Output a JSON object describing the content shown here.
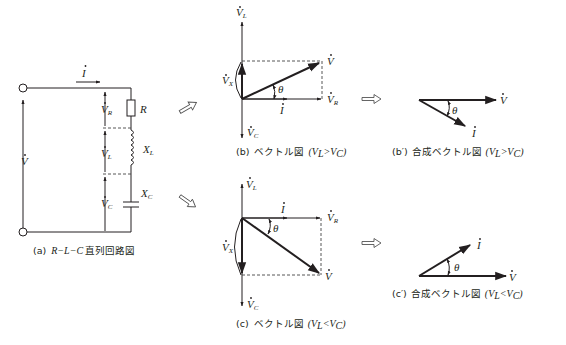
{
  "figure": {
    "panels": {
      "a": {
        "caption_prefix": "(a)",
        "caption_math": "R−L−C",
        "caption_text": "直列回路図",
        "labels": {
          "current": "I",
          "source_voltage": "V",
          "vr": "V",
          "vr_sub": "R",
          "vl": "V",
          "vl_sub": "L",
          "vc": "V",
          "vc_sub": "C",
          "resistor": "R",
          "xl": "X",
          "xl_sub": "L",
          "xc": "X",
          "xc_sub": "C"
        }
      },
      "b": {
        "caption_prefix": "(b)",
        "caption_text": "ベクトル図",
        "caption_cond": "(V",
        "cond_sub1": "L",
        "cond_op": ">V",
        "cond_sub2": "C",
        "cond_close": ")",
        "labels": {
          "vl": "V",
          "vl_sub": "L",
          "vc": "V",
          "vc_sub": "C",
          "vx": "V",
          "vx_sub": "X",
          "v": "V",
          "vr": "V",
          "vr_sub": "R",
          "i": "I",
          "theta": "θ"
        }
      },
      "b_prime": {
        "caption_prefix": "(b′)",
        "caption_text": "合成ベクトル図",
        "caption_cond": "(V",
        "cond_sub1": "L",
        "cond_op": ">V",
        "cond_sub2": "C",
        "cond_close": ")",
        "labels": {
          "v": "V",
          "i": "I",
          "theta": "θ"
        }
      },
      "c": {
        "caption_prefix": "(c)",
        "caption_text": "ベクトル図",
        "caption_cond": "(V",
        "cond_sub1": "L",
        "cond_op": "<V",
        "cond_sub2": "C",
        "cond_close": ")",
        "labels": {
          "vl": "V",
          "vl_sub": "L",
          "vc": "V",
          "vc_sub": "C",
          "vx": "V",
          "vx_sub": "X",
          "v": "V",
          "vr": "V",
          "vr_sub": "R",
          "i": "I",
          "theta": "θ"
        }
      },
      "c_prime": {
        "caption_prefix": "(c′)",
        "caption_text": "合成ベクトル図",
        "caption_cond": "(V",
        "cond_sub1": "L",
        "cond_op": "<V",
        "cond_sub2": "C",
        "cond_close": ")",
        "labels": {
          "v": "V",
          "i": "I",
          "theta": "θ"
        }
      }
    },
    "arrows": {
      "to_b": "hollow-arrow-up-right",
      "to_c": "hollow-arrow-down-right",
      "b_to_bprime": "hollow-arrow-right",
      "c_to_cprime": "hollow-arrow-right"
    },
    "colors": {
      "ink": "#231f20",
      "dash": "#444444",
      "background": "#ffffff"
    }
  }
}
